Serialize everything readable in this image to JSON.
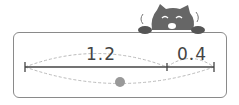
{
  "diagram": {
    "segments": [
      {
        "label": "1.2"
      },
      {
        "label": "0.4"
      }
    ],
    "unknown_marker": "gray-dot",
    "mascot": "cat-peeking-icon",
    "colors": {
      "line": "#444444",
      "dashed": "#bbbbbb",
      "dot": "#999999",
      "cat": "#666666",
      "frame": "#8a8a8a"
    }
  }
}
